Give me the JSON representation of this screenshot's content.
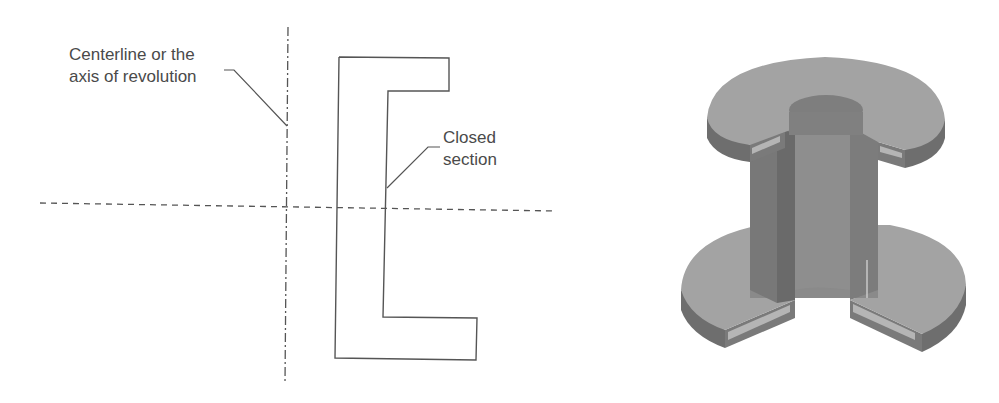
{
  "figure": {
    "left_panel": {
      "title": "2D profile sketch for revolved feature",
      "annotations": [
        {
          "id": "centerline",
          "lines": [
            "Centerline or the",
            "axis of revolution"
          ]
        },
        {
          "id": "closed-section",
          "lines": [
            "Closed",
            "section"
          ]
        }
      ],
      "elements": [
        "vertical centerline (dash-dot)",
        "horizontal reference line (dashed)",
        "C-shaped closed section profile"
      ]
    },
    "right_panel": {
      "title": "3D revolved solid (cut-away view)",
      "elements": [
        "top flange",
        "hollow tube",
        "bottom flange",
        "quarter section cutout"
      ]
    },
    "colors": {
      "line": "#555555",
      "text": "#4a4a4a",
      "solid_top_face": "#a3a3a3",
      "solid_side_face": "#7a7a7a",
      "solid_inner": "#8a8a8a",
      "solid_dark": "#6a6a6a",
      "section_face": "#b8b8b8"
    }
  }
}
